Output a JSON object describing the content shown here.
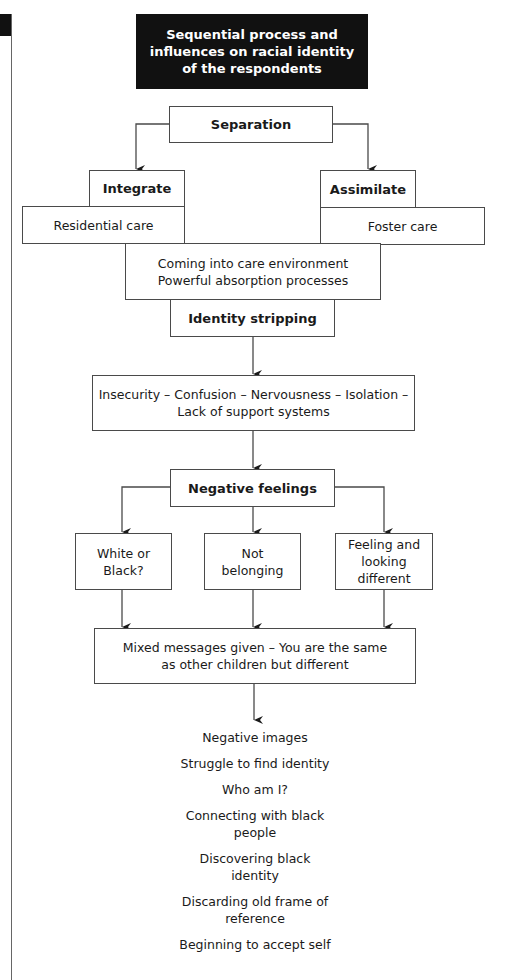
{
  "title": "Sequential process and\ninfluences on racial identity\nof the respondents",
  "nodes": {
    "separation": "Separation",
    "integrate": "Integrate",
    "assimilate": "Assimilate",
    "residential_care": "Residential care",
    "foster_care": "Foster care",
    "care_environment": "Coming into care environment\nPowerful absorption processes",
    "identity_stripping": "Identity stripping",
    "insecurity": "Insecurity – Confusion – Nervousness – Isolation –\nLack of support systems",
    "negative_feelings": "Negative feelings",
    "white_or_black": "White or\nBlack?",
    "not_belonging": "Not\nbelonging",
    "feeling_looking_different": "Feeling and\nlooking\ndifferent",
    "mixed_messages": "Mixed messages given – You are the same\nas other children but different"
  },
  "steps": [
    "Negative images",
    "Struggle to find identity",
    "Who am I?",
    "Connecting with black\npeople",
    "Discovering black\nidentity",
    "Discarding old frame of\nreference",
    "Beginning to accept self"
  ],
  "colors": {
    "title_bg": "#111111",
    "title_fg": "#ffffff",
    "line": "#4a4a4a"
  }
}
